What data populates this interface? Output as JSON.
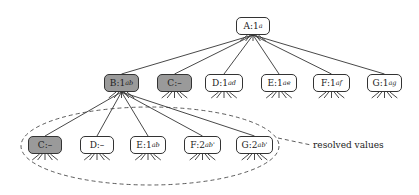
{
  "diagram": {
    "root": {
      "id": "A",
      "name": "A",
      "value": "1",
      "subscript": "a",
      "shaded": false,
      "x": 236,
      "y": 17,
      "w": 34
    },
    "level1": [
      {
        "id": "B1",
        "name": "B",
        "value": "1",
        "subscript": "ab",
        "shaded": true,
        "x": 104,
        "y": 74,
        "w": 35
      },
      {
        "id": "C1",
        "name": "C",
        "value": "–",
        "subscript": "",
        "shaded": true,
        "x": 157,
        "y": 74,
        "w": 35
      },
      {
        "id": "D1",
        "name": "D",
        "value": "1",
        "subscript": "ad",
        "shaded": false,
        "x": 205,
        "y": 74,
        "w": 38
      },
      {
        "id": "E1",
        "name": "E",
        "value": "1",
        "subscript": "ae",
        "shaded": false,
        "x": 261,
        "y": 74,
        "w": 36
      },
      {
        "id": "F1",
        "name": "F",
        "value": "1",
        "subscript": "af",
        "shaded": false,
        "x": 313,
        "y": 74,
        "w": 37
      },
      {
        "id": "G1",
        "name": "G",
        "value": "1",
        "subscript": "ag",
        "shaded": false,
        "x": 367,
        "y": 74,
        "w": 35
      }
    ],
    "level2": [
      {
        "id": "C2",
        "name": "C",
        "value": "–",
        "subscript": "",
        "shaded": true,
        "x": 28,
        "y": 136,
        "w": 34
      },
      {
        "id": "D2",
        "name": "D",
        "value": "–",
        "subscript": "",
        "shaded": false,
        "x": 80,
        "y": 136,
        "w": 34
      },
      {
        "id": "E2",
        "name": "E",
        "value": "1",
        "subscript": "ab",
        "shaded": false,
        "x": 130,
        "y": 136,
        "w": 36
      },
      {
        "id": "F2",
        "name": "F",
        "value": "2",
        "subscript": "ab'",
        "shaded": false,
        "x": 184,
        "y": 136,
        "w": 37
      },
      {
        "id": "G2",
        "name": "G",
        "value": "2",
        "subscript": "ab'",
        "shaded": false,
        "x": 236,
        "y": 136,
        "w": 37
      }
    ],
    "annotation": {
      "text": "resolved values",
      "x": 313,
      "y": 140
    },
    "colors": {
      "shaded_fill": "#9a9a9a",
      "border": "#333333",
      "line": "#333333",
      "background": "#ffffff"
    }
  }
}
